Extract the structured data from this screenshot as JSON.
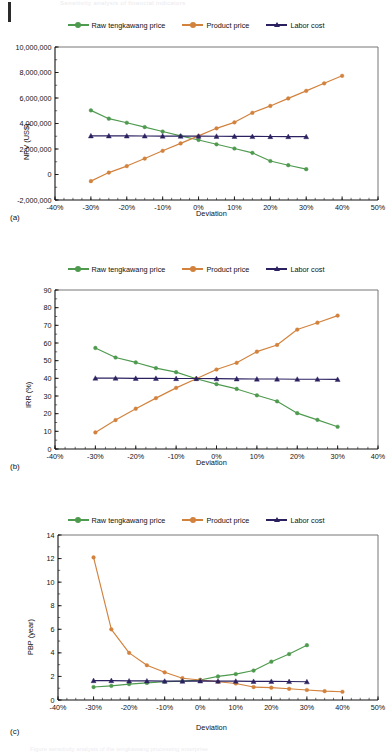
{
  "figure": {
    "header_faint": "Sensitivity analysis of financial indicators",
    "footer_faint": "Figure sensitivity analysis of the tengkawang processing enterprise",
    "page_edge": "page-edge-bar",
    "colors": {
      "raw_tengkawang_price": "#4e9a4e",
      "product_price": "#d2823c",
      "labor_cost": "#2b2160",
      "axis": "#1a1a1a",
      "plot_border": "#555555",
      "background": "#ffffff"
    },
    "legend": [
      {
        "label": "Raw tengkawang price",
        "color": "#4e9a4e",
        "marker": "circle"
      },
      {
        "label": "Product price",
        "color": "#d2823c",
        "marker": "circle"
      },
      {
        "label": "Labor cost",
        "color": "#2b2160",
        "marker": "triangle"
      }
    ]
  },
  "chart_data": [
    {
      "type": "line",
      "tag": "(a)",
      "title": "",
      "xlabel": "Deviation",
      "ylabel": "NPV (US$)",
      "xlim": [
        -40,
        50
      ],
      "ylim": [
        -2000000,
        10000000
      ],
      "xticks": [
        -40,
        -30,
        -20,
        -10,
        0,
        10,
        20,
        30,
        40,
        50
      ],
      "xticklabels": [
        "-40%",
        "-30%",
        "-20%",
        "-10%",
        "0%",
        "10%",
        "20%",
        "30%",
        "40%",
        "50%"
      ],
      "yticks": [
        -2000000,
        0,
        2000000,
        4000000,
        6000000,
        8000000,
        10000000
      ],
      "yticklabels": [
        "-2,000,000",
        "0",
        "2,000,000",
        "4,000,000",
        "6,000,000",
        "8,000,000",
        "10,000,000"
      ],
      "grid": false,
      "legend_position": "top-center",
      "series": [
        {
          "name": "Raw tengkawang price",
          "color": "#4e9a4e",
          "marker": "circle",
          "x": [
            -30,
            -25,
            -20,
            -15,
            -10,
            -5,
            0,
            5,
            10,
            15,
            20,
            25,
            30
          ],
          "values": [
            5030000,
            4380000,
            4060000,
            3720000,
            3370000,
            3030000,
            2710000,
            2370000,
            2040000,
            1700000,
            1060000,
            730000,
            420000
          ]
        },
        {
          "name": "Product price",
          "color": "#d2823c",
          "marker": "circle",
          "x": [
            -30,
            -25,
            -20,
            -15,
            -10,
            -5,
            0,
            5,
            10,
            15,
            20,
            25,
            30,
            35,
            40
          ],
          "values": [
            -520000,
            150000,
            660000,
            1250000,
            1860000,
            2440000,
            3030000,
            3620000,
            4090000,
            4840000,
            5380000,
            5970000,
            6560000,
            7150000,
            7740000
          ]
        },
        {
          "name": "Labor cost",
          "color": "#2b2160",
          "marker": "triangle",
          "x": [
            -30,
            -25,
            -20,
            -15,
            -10,
            -5,
            0,
            5,
            10,
            15,
            20,
            25,
            30
          ],
          "values": [
            3030000,
            3030000,
            3025000,
            3020000,
            3015000,
            3010000,
            3005000,
            3000000,
            2995000,
            2985000,
            2980000,
            2975000,
            2970000
          ]
        }
      ]
    },
    {
      "type": "line",
      "tag": "(b)",
      "title": "",
      "xlabel": "Deviation",
      "ylabel": "IRR (%)",
      "xlim": [
        -40,
        40
      ],
      "ylim": [
        0,
        90
      ],
      "xticks": [
        -40,
        -30,
        -20,
        -10,
        0,
        10,
        20,
        30,
        40
      ],
      "xticklabels": [
        "-40%",
        "-30%",
        "-20%",
        "-10%",
        "0%",
        "10%",
        "20%",
        "30%",
        "40%"
      ],
      "yticks": [
        0,
        10,
        20,
        30,
        40,
        50,
        60,
        70,
        80,
        90
      ],
      "yticklabels": [
        "0",
        "10",
        "20",
        "30",
        "40",
        "50",
        "60",
        "70",
        "80",
        "90"
      ],
      "grid": false,
      "legend_position": "top-center",
      "series": [
        {
          "name": "Raw tengkawang price",
          "color": "#4e9a4e",
          "marker": "circle",
          "x": [
            -30,
            -25,
            -20,
            -15,
            -10,
            -5,
            0,
            5,
            10,
            15,
            20,
            25,
            30
          ],
          "values": [
            57.2,
            51.8,
            49.0,
            45.8,
            43.5,
            39.8,
            36.7,
            34.0,
            30.4,
            27.0,
            20.3,
            16.5,
            12.6
          ]
        },
        {
          "name": "Product price",
          "color": "#d2823c",
          "marker": "circle",
          "x": [
            -30,
            -25,
            -20,
            -15,
            -10,
            -5,
            0,
            5,
            10,
            15,
            20,
            25,
            30
          ],
          "values": [
            9.4,
            16.4,
            22.8,
            28.8,
            34.6,
            39.8,
            45.0,
            48.8,
            55.1,
            58.9,
            67.6,
            71.5,
            75.5
          ]
        },
        {
          "name": "Labor cost",
          "color": "#2b2160",
          "marker": "triangle",
          "x": [
            -30,
            -25,
            -20,
            -15,
            -10,
            -5,
            0,
            5,
            10,
            15,
            20,
            25,
            30
          ],
          "values": [
            40.1,
            40.1,
            40.0,
            40.0,
            39.9,
            39.9,
            39.8,
            39.7,
            39.6,
            39.6,
            39.5,
            39.5,
            39.4
          ]
        }
      ]
    },
    {
      "type": "line",
      "tag": "(c)",
      "title": "",
      "xlabel": "Deviation",
      "ylabel": "PBP (year)",
      "xlim": [
        -40,
        50
      ],
      "ylim": [
        0,
        14
      ],
      "xticks": [
        -40,
        -30,
        -20,
        -10,
        0,
        10,
        20,
        30,
        40,
        50
      ],
      "xticklabels": [
        "-40%",
        "-30%",
        "-20%",
        "-10%",
        "0%",
        "10%",
        "20%",
        "30%",
        "40%",
        "50%"
      ],
      "yticks": [
        0,
        2,
        4,
        6,
        8,
        10,
        12,
        14
      ],
      "yticklabels": [
        "0",
        "2",
        "4",
        "6",
        "8",
        "10",
        "12",
        "14"
      ],
      "grid": false,
      "legend_position": "top-center",
      "series": [
        {
          "name": "Raw tengkawang price",
          "color": "#4e9a4e",
          "marker": "circle",
          "x": [
            -30,
            -25,
            -20,
            -15,
            -10,
            -5,
            0,
            5,
            10,
            15,
            20,
            25,
            30
          ],
          "values": [
            1.1,
            1.2,
            1.35,
            1.45,
            1.55,
            1.6,
            1.7,
            2.0,
            2.2,
            2.5,
            3.25,
            3.9,
            4.65
          ]
        },
        {
          "name": "Product price",
          "color": "#d2823c",
          "marker": "circle",
          "x": [
            -30,
            -25,
            -20,
            -15,
            -10,
            -5,
            0,
            5,
            10,
            15,
            20,
            25,
            30,
            35,
            40
          ],
          "values": [
            12.1,
            6.0,
            4.0,
            2.95,
            2.35,
            1.85,
            1.7,
            1.55,
            1.4,
            1.1,
            1.05,
            0.95,
            0.85,
            0.75,
            0.7
          ]
        },
        {
          "name": "Labor cost",
          "color": "#2b2160",
          "marker": "triangle",
          "x": [
            -30,
            -25,
            -20,
            -15,
            -10,
            -5,
            0,
            5,
            10,
            15,
            20,
            25,
            30
          ],
          "values": [
            1.65,
            1.65,
            1.62,
            1.62,
            1.6,
            1.6,
            1.62,
            1.6,
            1.6,
            1.58,
            1.58,
            1.57,
            1.55
          ]
        }
      ]
    }
  ]
}
